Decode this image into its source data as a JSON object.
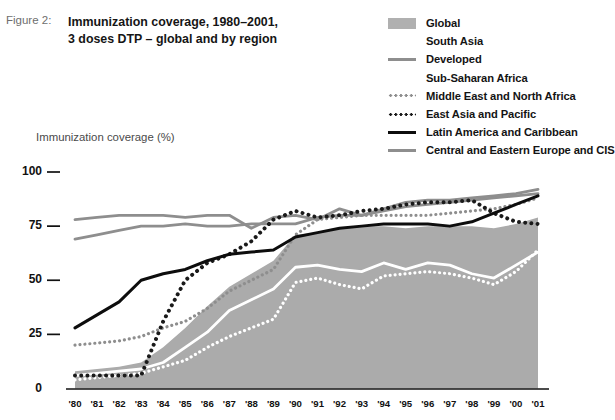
{
  "figure": {
    "label": "Figure 2:",
    "title_line1": "Immunization coverage, 1980–2001,",
    "title_line2": "3 doses DTP – global and by region"
  },
  "axis": {
    "y_title": "Immunization coverage (%)",
    "y_ticks": [
      "0",
      "25",
      "50",
      "75",
      "100"
    ],
    "x_ticks": [
      "'80",
      "'81",
      "'82",
      "'83",
      "'84",
      "'85",
      "'86",
      "'87",
      "'88",
      "'89",
      "'90",
      "'91",
      "'92",
      "'93",
      "'94",
      "'95",
      "'96",
      "'97",
      "'98",
      "'99",
      "'00",
      "'01"
    ]
  },
  "legend": {
    "items": [
      {
        "label": "Global",
        "style": "area",
        "color": "#b0b0b0"
      },
      {
        "label": "South Asia",
        "style": "solid",
        "color": "#ffffff"
      },
      {
        "label": "Developed",
        "style": "solid",
        "color": "#8e8e8e"
      },
      {
        "label": "Sub-Saharan Africa",
        "style": "dotted",
        "color": "#ffffff"
      },
      {
        "label": "Middle East and North Africa",
        "style": "dotted",
        "color": "#8e8e8e"
      },
      {
        "label": "East Asia and Pacific",
        "style": "dotted",
        "color": "#1a1a1a"
      },
      {
        "label": "Latin America and Caribbean",
        "style": "solid",
        "color": "#0d0d0d"
      },
      {
        "label": "Central and Eastern Europe and CIS",
        "style": "solid",
        "color": "#8e8e8e"
      }
    ]
  },
  "chart_data": {
    "type": "line",
    "title": "Immunization coverage, 1980–2001, 3 doses DTP – global and by region",
    "xlabel": "",
    "ylabel": "Immunization coverage (%)",
    "ylim": [
      0,
      100
    ],
    "grid": false,
    "legend_position": "top-right",
    "x": [
      "'80",
      "'81",
      "'82",
      "'83",
      "'84",
      "'85",
      "'86",
      "'87",
      "'88",
      "'89",
      "'90",
      "'91",
      "'92",
      "'93",
      "'94",
      "'95",
      "'96",
      "'97",
      "'98",
      "'99",
      "'00",
      "'01"
    ],
    "series": [
      {
        "name": "Global",
        "style": "area",
        "color": "#ababab",
        "values": [
          8,
          9,
          10,
          12,
          19,
          28,
          38,
          47,
          53,
          59,
          71,
          72,
          74,
          75,
          75,
          74,
          75,
          75,
          75,
          74,
          76,
          79
        ]
      },
      {
        "name": "South Asia",
        "style": "solid",
        "color": "#ffffff",
        "values": [
          6,
          7,
          8,
          9,
          12,
          19,
          26,
          36,
          41,
          46,
          56,
          57,
          55,
          54,
          58,
          55,
          58,
          57,
          53,
          51,
          57,
          63
        ]
      },
      {
        "name": "Developed",
        "style": "solid",
        "color": "#8e8e8e",
        "values": [
          69,
          71,
          73,
          75,
          75,
          76,
          75,
          75,
          76,
          76,
          76,
          79,
          80,
          80,
          82,
          84,
          85,
          86,
          87,
          88,
          89,
          90
        ]
      },
      {
        "name": "Sub-Saharan Africa",
        "style": "dotted",
        "color": "#ffffff",
        "values": [
          4,
          5,
          6,
          7,
          10,
          13,
          19,
          24,
          28,
          32,
          49,
          51,
          48,
          46,
          52,
          53,
          54,
          53,
          51,
          48,
          54,
          64
        ]
      },
      {
        "name": "Middle East and North Africa",
        "style": "dotted",
        "color": "#8e8e8e",
        "values": [
          20,
          21,
          22,
          24,
          28,
          31,
          37,
          45,
          50,
          55,
          71,
          78,
          79,
          80,
          80,
          80,
          80,
          81,
          82,
          83,
          85,
          88
        ]
      },
      {
        "name": "East Asia and Pacific",
        "style": "dotted",
        "color": "#1a1a1a",
        "values": [
          6,
          6,
          6,
          6,
          31,
          50,
          58,
          62,
          68,
          78,
          82,
          79,
          80,
          82,
          83,
          85,
          86,
          86,
          87,
          81,
          77,
          76
        ]
      },
      {
        "name": "Latin America and Caribbean",
        "style": "solid",
        "color": "#0d0d0d",
        "values": [
          28,
          34,
          40,
          50,
          53,
          55,
          59,
          62,
          63,
          64,
          70,
          72,
          74,
          75,
          76,
          76,
          76,
          75,
          77,
          81,
          85,
          89
        ]
      },
      {
        "name": "Central and Eastern Europe and CIS",
        "style": "solid",
        "color": "#8e8e8e",
        "values": [
          78,
          79,
          80,
          80,
          80,
          79,
          80,
          80,
          74,
          79,
          80,
          78,
          83,
          80,
          83,
          86,
          87,
          87,
          88,
          89,
          90,
          92
        ]
      }
    ]
  }
}
